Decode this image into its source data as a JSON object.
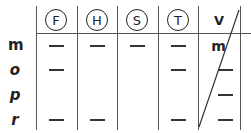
{
  "table": {
    "columns": [
      {
        "label": "F",
        "circled": true
      },
      {
        "label": "H",
        "circled": true
      },
      {
        "label": "S",
        "circled": true
      },
      {
        "label": "T",
        "circled": true
      },
      {
        "label": "V",
        "circled": false
      }
    ],
    "rows": [
      {
        "label": "m",
        "cells": [
          "—",
          "—",
          "—",
          "—",
          "m"
        ]
      },
      {
        "label": "o",
        "cells": [
          "—",
          "",
          "",
          "—",
          "—"
        ]
      },
      {
        "label": "p",
        "cells": [
          "",
          "",
          "",
          "",
          "—"
        ]
      },
      {
        "label": "r",
        "cells": [
          "—",
          "—",
          "",
          "—",
          "—"
        ]
      }
    ],
    "v_column_crossed_out": true
  }
}
